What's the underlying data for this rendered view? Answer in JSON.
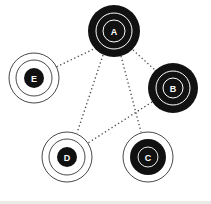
{
  "diagram": {
    "type": "network-graph",
    "nodes": [
      {
        "id": "A",
        "label": "A",
        "cx": 114,
        "cy": 31,
        "style": "filled",
        "r": 26
      },
      {
        "id": "B",
        "label": "B",
        "cx": 173,
        "cy": 88,
        "style": "filled",
        "r": 25
      },
      {
        "id": "C",
        "label": "C",
        "cx": 148,
        "cy": 157,
        "style": "partial",
        "r": 26
      },
      {
        "id": "D",
        "label": "D",
        "cx": 67,
        "cy": 157,
        "style": "outline",
        "r": 26
      },
      {
        "id": "E",
        "label": "E",
        "cx": 34,
        "cy": 78,
        "style": "outline",
        "r": 26
      }
    ],
    "edges": [
      {
        "from": "A",
        "to": "E"
      },
      {
        "from": "A",
        "to": "D"
      },
      {
        "from": "A",
        "to": "C"
      },
      {
        "from": "A",
        "to": "B"
      },
      {
        "from": "B",
        "to": "D"
      }
    ],
    "colors": {
      "node": "#111111",
      "line": "#444444",
      "background": "#ffffff"
    }
  }
}
